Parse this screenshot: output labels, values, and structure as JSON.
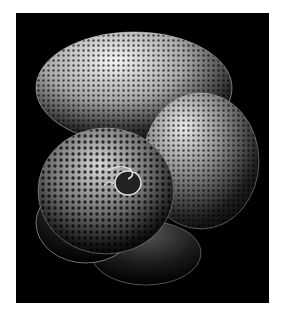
{
  "image": {
    "subject": "foraminifera shell (scanning electron micrograph)",
    "background_color": "#000000",
    "border_color": "#ffffff",
    "chambers": 5
  }
}
